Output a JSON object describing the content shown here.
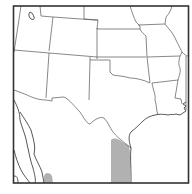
{
  "map": {
    "type": "range-map",
    "region": "South-central United States and northern Mexico",
    "colors": {
      "background": "#ffffff",
      "border": "#555555",
      "frame": "#333333",
      "range_fill": "#a9a9a9"
    },
    "range_areas": [
      {
        "name": "south-texas-coastal-range",
        "description": "Shaded strip along lower Rio Grande / Gulf coast of Texas"
      },
      {
        "name": "western-mexico-range",
        "description": "Small shaded patch in northwestern Mexico near Sonora/Sinaloa coast"
      }
    ],
    "features": [
      "state-borders",
      "mexico-border",
      "gulf-coastline",
      "great-salt-lake"
    ]
  }
}
